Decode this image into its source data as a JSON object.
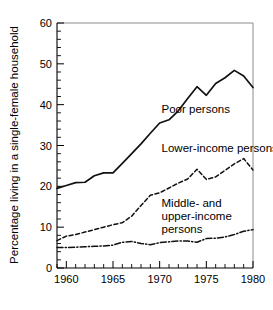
{
  "figure": {
    "background_color": "#ffffff",
    "line_color": "#111111",
    "axis_color": "#000000"
  },
  "chart_data": {
    "type": "line",
    "title": "",
    "xlabel": "",
    "ylabel": "Percentage living in a single-female household",
    "xlim": [
      1959,
      1980
    ],
    "ylim": [
      0,
      60
    ],
    "grid": false,
    "legend_position": "inline-annotations",
    "x_ticks_major": [
      1960,
      1965,
      1970,
      1975,
      1980
    ],
    "x_tick_labels": [
      "1960",
      "1965",
      "1970",
      "1975",
      "1980"
    ],
    "x_ticks_minor_step": 1,
    "y_ticks_major": [
      0,
      10,
      20,
      30,
      40,
      50,
      60
    ],
    "y_tick_labels": [
      "0",
      "10",
      "20",
      "30",
      "40",
      "50",
      "60"
    ],
    "y_ticks_minor_step": 2,
    "x": [
      1959,
      1960,
      1961,
      1962,
      1963,
      1964,
      1965,
      1966,
      1967,
      1968,
      1969,
      1970,
      1971,
      1972,
      1973,
      1974,
      1975,
      1976,
      1977,
      1978,
      1979,
      1980
    ],
    "series": [
      {
        "name": "Poor persons",
        "label": "Poor persons",
        "style": "solid",
        "label_x": 1970.2,
        "label_y": 38.0,
        "values": [
          19.5,
          20.2,
          20.9,
          21.0,
          22.6,
          23.3,
          23.3,
          25.6,
          28.0,
          30.4,
          33.0,
          35.5,
          36.3,
          38.5,
          41.5,
          44.4,
          42.3,
          45.2,
          46.6,
          48.4,
          47.0,
          44.2
        ]
      },
      {
        "name": "Lower-income persons",
        "label": "Lower-income persons",
        "style": "dashed",
        "label_x": 1970.2,
        "label_y": 28.5,
        "values": [
          6.7,
          7.8,
          8.2,
          8.8,
          9.4,
          10.0,
          10.6,
          11.1,
          12.7,
          15.3,
          17.8,
          18.4,
          19.6,
          20.8,
          21.8,
          24.2,
          21.7,
          22.3,
          23.9,
          25.5,
          26.8,
          24.0
        ]
      },
      {
        "name": "Middle- and upper-income persons",
        "label": "Middle- and upper-income persons",
        "label_lines": [
          "Middle- and",
          "upper-income",
          "persons"
        ],
        "style": "dashdot",
        "label_x": 1970.2,
        "label_y": 15.0,
        "values": [
          5.0,
          5.0,
          5.1,
          5.2,
          5.3,
          5.4,
          5.6,
          6.3,
          6.5,
          6.0,
          5.7,
          6.2,
          6.4,
          6.6,
          6.6,
          6.3,
          7.2,
          7.3,
          7.6,
          8.2,
          9.0,
          9.4
        ]
      }
    ]
  }
}
